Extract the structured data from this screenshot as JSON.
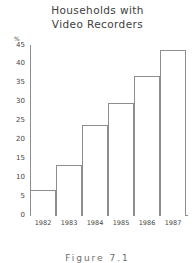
{
  "chart_data": {
    "type": "bar",
    "title": "Households with Video Recorders",
    "title_lines": [
      "Households with",
      "Video Recorders"
    ],
    "categories": [
      "1982",
      "1983",
      "1984",
      "1985",
      "1986",
      "1987"
    ],
    "values": [
      7,
      13.5,
      24,
      30,
      37,
      44
    ],
    "xlabel": "",
    "ylabel": "",
    "y_unit": "%",
    "ylim": [
      0,
      45
    ],
    "ytick_labels": [
      "0",
      "5",
      "10",
      "15",
      "20",
      "25",
      "30",
      "35",
      "40",
      "45"
    ],
    "yticks": [
      0,
      5,
      10,
      15,
      20,
      25,
      30,
      35,
      40,
      45
    ],
    "grid": false,
    "legend": null,
    "bar_style": {
      "fill": "#ffffff",
      "outline": "#8d8d8d",
      "gap": 0
    }
  },
  "figure": {
    "caption": "Figure 7.1"
  },
  "colors": {
    "background": "#ffffff",
    "axis": "#8d8d8d",
    "text": "#454545"
  }
}
